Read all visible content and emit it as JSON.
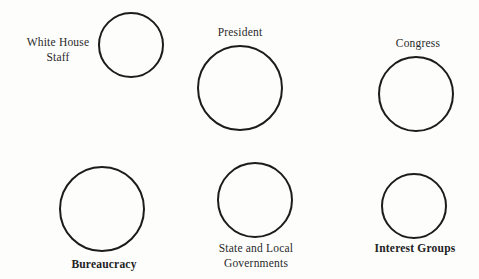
{
  "diagram": {
    "type": "node-diagram",
    "background": "#fdfdfc",
    "stroke_color": "#1c1c1c",
    "nodes": [
      {
        "id": "white-house-staff",
        "label_lines": [
          "White House",
          "Staff"
        ],
        "circle": {
          "cx": 131,
          "cy": 45,
          "r": 33
        },
        "label_pos": {
          "x": 58,
          "y": 35
        },
        "bold": false
      },
      {
        "id": "president",
        "label_lines": [
          "President"
        ],
        "circle": {
          "cx": 240,
          "cy": 88,
          "r": 43
        },
        "label_pos": {
          "x": 240,
          "y": 25
        },
        "bold": false
      },
      {
        "id": "congress",
        "label_lines": [
          "Congress"
        ],
        "circle": {
          "cx": 416,
          "cy": 94,
          "r": 38
        },
        "label_pos": {
          "x": 418,
          "y": 36
        },
        "bold": false
      },
      {
        "id": "bureaucracy",
        "label_lines": [
          "Bureaucracy"
        ],
        "circle": {
          "cx": 102,
          "cy": 209,
          "r": 43
        },
        "label_pos": {
          "x": 104,
          "y": 257
        },
        "bold": true
      },
      {
        "id": "state-and-local-governments",
        "label_lines": [
          "State and Local",
          "Governments"
        ],
        "circle": {
          "cx": 255,
          "cy": 200,
          "r": 38
        },
        "label_pos": {
          "x": 256,
          "y": 241
        },
        "bold": false
      },
      {
        "id": "interest-groups",
        "label_lines": [
          "Interest Groups"
        ],
        "circle": {
          "cx": 414,
          "cy": 206,
          "r": 33
        },
        "label_pos": {
          "x": 415,
          "y": 241
        },
        "bold": true
      }
    ]
  }
}
